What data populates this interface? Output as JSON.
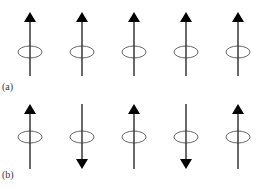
{
  "figure": {
    "panels": [
      {
        "id": "a",
        "label": "(a)",
        "label_pos": {
          "x": 2,
          "y": 81
        },
        "arrows": [
          {
            "x": 30,
            "direction": "up"
          },
          {
            "x": 82,
            "direction": "up"
          },
          {
            "x": 134,
            "direction": "up"
          },
          {
            "x": 186,
            "direction": "up"
          },
          {
            "x": 238,
            "direction": "up"
          }
        ],
        "y_top": 12,
        "y_bottom": 76,
        "ellipse_cy": 52
      },
      {
        "id": "b",
        "label": "(b)",
        "label_pos": {
          "x": 2,
          "y": 169
        },
        "arrows": [
          {
            "x": 30,
            "direction": "up"
          },
          {
            "x": 82,
            "direction": "down"
          },
          {
            "x": 134,
            "direction": "up"
          },
          {
            "x": 186,
            "direction": "down"
          },
          {
            "x": 238,
            "direction": "up"
          }
        ],
        "y_top": 104,
        "y_bottom": 169,
        "ellipse_cy": 137
      }
    ],
    "style": {
      "line_color": "#2a2a2a",
      "arrowhead_color": "#000000",
      "ellipse_color": "#555555",
      "ellipse_rx": 12,
      "ellipse_ry": 6
    }
  }
}
